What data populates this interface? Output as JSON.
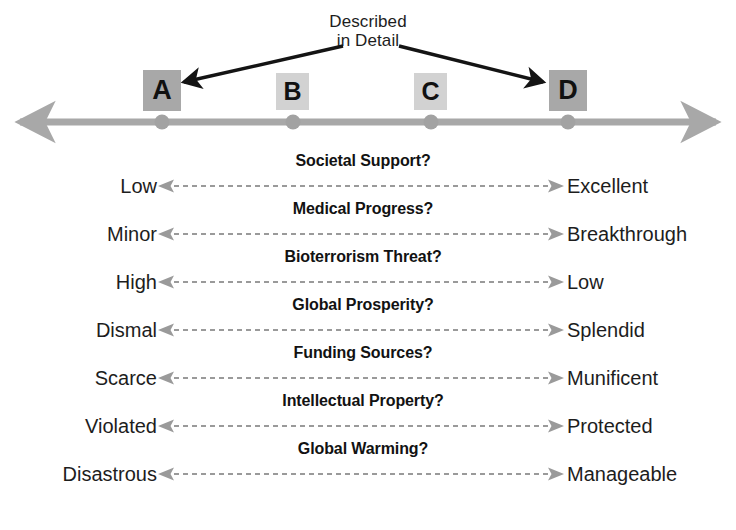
{
  "callout": {
    "line1": "Described",
    "line2": "in Detail",
    "arrow_targets": [
      "A",
      "D"
    ]
  },
  "axis": {
    "name": "scenario-axis",
    "left_arrow": "axis-arrow-left",
    "right_arrow": "axis-arrow-right",
    "color": "#a8a8a8",
    "scenarios": [
      {
        "label": "A",
        "emphasis": "major"
      },
      {
        "label": "B",
        "emphasis": "minor"
      },
      {
        "label": "C",
        "emphasis": "minor"
      },
      {
        "label": "D",
        "emphasis": "major"
      }
    ]
  },
  "dimensions": [
    {
      "title": "Societal Support?",
      "left": "Low",
      "right": "Excellent"
    },
    {
      "title": "Medical Progress?",
      "left": "Minor",
      "right": "Breakthrough"
    },
    {
      "title": "Bioterrorism Threat?",
      "left": "High",
      "right": "Low"
    },
    {
      "title": "Global Prosperity?",
      "left": "Dismal",
      "right": "Splendid"
    },
    {
      "title": "Funding Sources?",
      "left": "Scarce",
      "right": "Munificent"
    },
    {
      "title": "Intellectual Property?",
      "left": "Violated",
      "right": "Protected"
    },
    {
      "title": "Global Warming?",
      "left": "Disastrous",
      "right": "Manageable"
    }
  ],
  "colors": {
    "axis_gray": "#a8a8a8",
    "box_major": "#a8a8a8",
    "box_minor": "#d2d2d2",
    "dashed_arrow": "#9a9a9a",
    "text": "#1d1d1d"
  }
}
